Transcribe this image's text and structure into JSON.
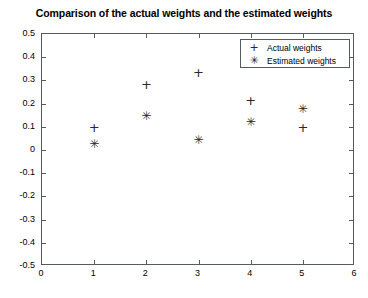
{
  "chart_data": {
    "type": "scatter",
    "title": "Comparison of the actual weights and the estimated weights",
    "xlabel": "",
    "ylabel": "",
    "xlim": [
      0,
      6
    ],
    "ylim": [
      -0.5,
      0.5
    ],
    "xticks": [
      "0",
      "1",
      "2",
      "3",
      "4",
      "5",
      "6"
    ],
    "yticks": [
      "0.5",
      "0.4",
      "0.3",
      "0.2",
      "0.1",
      "0",
      "-0.1",
      "-0.2",
      "-0.3",
      "-0.4",
      "-0.5"
    ],
    "grid": false,
    "legend_position": "top-right",
    "x": [
      1,
      2,
      3,
      4,
      5
    ],
    "series": [
      {
        "name": "Actual weights",
        "marker": "+",
        "color": "#2a2a2a",
        "values": [
          0.1,
          0.285,
          0.335,
          0.215,
          0.098
        ]
      },
      {
        "name": "Estimated weights",
        "marker": "*",
        "color": "#2a2a2a",
        "values": [
          0.025,
          0.148,
          0.045,
          0.122,
          0.178
        ]
      }
    ]
  },
  "legend": {
    "entries": [
      {
        "marker": "+",
        "label": "Actual weights"
      },
      {
        "marker": "✳",
        "label": "Estimated weights"
      }
    ]
  }
}
